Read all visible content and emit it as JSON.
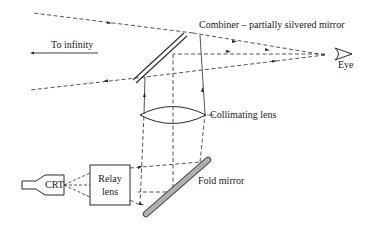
{
  "diagram": {
    "labels": {
      "to_infinity": "To infinity",
      "combiner": "Combiner – partially silvered mirror",
      "eye": "Eye",
      "collimating_lens": "Collimating lens",
      "crt": "CRT",
      "relay_lens_line1": "Relay",
      "relay_lens_line2": "lens",
      "fold_mirror": "Fold mirror"
    },
    "components": [
      "CRT",
      "Relay lens",
      "Fold mirror",
      "Collimating lens",
      "Combiner – partially silvered mirror",
      "Eye"
    ],
    "colors": {
      "line": "#2a2a2a",
      "fold_mirror_fill": "#b0b0b0",
      "background": "#ffffff"
    }
  }
}
